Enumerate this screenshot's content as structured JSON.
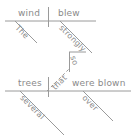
{
  "diagram": {
    "type": "reed-kellogg-sentence-diagram",
    "sentence": "The wind blew so strongly that several trees were blown over.",
    "ink_color": "#9a9a9a",
    "text_color": "#8a8a8a",
    "background": "#ffffff",
    "clauses": [
      {
        "name": "independent-clause",
        "baseline_y": 21,
        "subject": "wind",
        "predicate": "blew",
        "modifiers": [
          {
            "word": "The",
            "modifies": "wind"
          },
          {
            "word": "strongly",
            "modifies": "blew"
          }
        ]
      },
      {
        "name": "dependent-clause",
        "baseline_y": 91,
        "subject": "trees",
        "predicate": "were blown",
        "modifiers": [
          {
            "word": "several",
            "modifies": "trees"
          },
          {
            "word": "over",
            "modifies": "were blown"
          }
        ]
      }
    ],
    "connectors": [
      {
        "word": "so",
        "kind": "correlative"
      },
      {
        "word": "that",
        "kind": "subordinating-conjunction-dashed"
      }
    ],
    "labels": {
      "the": "The",
      "wind": "wind",
      "blew": "blew",
      "strongly": "strongly",
      "so": "so",
      "that": "that",
      "several": "several",
      "trees": "trees",
      "were_blown": "were blown",
      "over": "over"
    }
  }
}
